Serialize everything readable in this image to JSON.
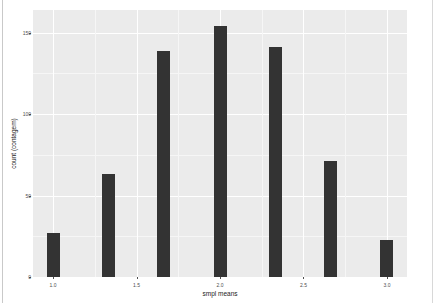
{
  "chart_data": {
    "type": "bar",
    "title": "",
    "subtitle": "",
    "xlabel": "smpl means",
    "ylabel": "count (contagem)",
    "x": [
      1.0,
      1.33,
      1.66,
      2.0,
      2.33,
      2.66,
      3.0
    ],
    "values": [
      27,
      63,
      139,
      154,
      141,
      71,
      23
    ],
    "categories": [
      "1.0",
      "1.33",
      "1.66",
      "2.0",
      "2.33",
      "2.66",
      "3.0"
    ],
    "xlim": [
      0.88,
      3.12
    ],
    "ylim": [
      0,
      164
    ],
    "x_ticks": [
      {
        "value": 1.0,
        "label": "1.0"
      },
      {
        "value": 1.5,
        "label": "1.5"
      },
      {
        "value": 2.0,
        "label": "2.0"
      },
      {
        "value": 2.5,
        "label": "2.5"
      },
      {
        "value": 3.0,
        "label": "3.0"
      }
    ],
    "y_ticks": [
      {
        "value": 0,
        "label": "0"
      },
      {
        "value": 50,
        "label": "50"
      },
      {
        "value": 100,
        "label": "100"
      },
      {
        "value": 150,
        "label": "150"
      }
    ],
    "x_minor_ticks": [
      1.25,
      1.75,
      2.25,
      2.75
    ],
    "y_minor_ticks": [
      25,
      75,
      125
    ],
    "grid": true,
    "legend": null,
    "legend_position": "none",
    "bar_color": "#333333",
    "panel_background": "#ebebeb",
    "grid_major_color": "#ffffff",
    "grid_minor_color": "#f6f6f6",
    "plot_background": "#ffffff",
    "axis_text_color": "#4d4d4d",
    "axis_title_color": "#1a1a1a"
  }
}
